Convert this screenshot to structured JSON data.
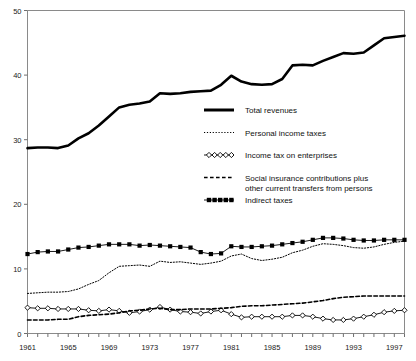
{
  "chart_data": {
    "type": "line",
    "title": "",
    "subtitle": "",
    "xlabel": "",
    "ylabel": "",
    "xlim": [
      1961,
      1998
    ],
    "ylim": [
      0,
      50
    ],
    "yticks": [
      0,
      10,
      20,
      30,
      40,
      50
    ],
    "xticks": [
      1961,
      1965,
      1969,
      1973,
      1977,
      1981,
      1985,
      1989,
      1993,
      1997
    ],
    "xtick_labels": [
      "1961",
      "1965",
      "1969",
      "1973",
      "1977",
      "1981",
      "1985",
      "1989",
      "1993",
      "1997"
    ],
    "ytick_labels": [
      "0",
      "10",
      "20",
      "30",
      "40",
      "50"
    ],
    "x": [
      1961,
      1962,
      1963,
      1964,
      1965,
      1966,
      1967,
      1968,
      1969,
      1970,
      1971,
      1972,
      1973,
      1974,
      1975,
      1976,
      1977,
      1978,
      1979,
      1980,
      1981,
      1982,
      1983,
      1984,
      1985,
      1986,
      1987,
      1988,
      1989,
      1990,
      1991,
      1992,
      1993,
      1994,
      1995,
      1996,
      1997,
      1998
    ],
    "grid": false,
    "legend_position": "center-right",
    "series": [
      {
        "name": "Total revenues",
        "style": "thick-solid",
        "marker": "none",
        "color": "#000000",
        "values": [
          28.7,
          28.8,
          28.8,
          28.7,
          29.1,
          30.2,
          31.0,
          32.2,
          33.6,
          35.0,
          35.4,
          35.6,
          35.9,
          37.2,
          37.1,
          37.2,
          37.4,
          37.5,
          37.6,
          38.5,
          39.9,
          39.0,
          38.6,
          38.5,
          38.6,
          39.4,
          41.5,
          41.6,
          41.5,
          42.2,
          42.8,
          43.4,
          43.3,
          43.5,
          44.6,
          45.7,
          45.9,
          46.1
        ]
      },
      {
        "name": "Personal income taxes",
        "style": "dotted",
        "marker": "none",
        "color": "#000000",
        "values": [
          6.2,
          6.3,
          6.4,
          6.4,
          6.5,
          6.9,
          7.6,
          8.2,
          9.4,
          10.4,
          10.5,
          10.6,
          10.4,
          11.2,
          11.0,
          11.1,
          10.9,
          10.7,
          10.9,
          11.2,
          12.0,
          12.3,
          11.6,
          11.3,
          11.5,
          11.8,
          12.5,
          12.9,
          13.5,
          13.9,
          13.8,
          13.6,
          13.3,
          13.2,
          13.4,
          13.8,
          14.1,
          14.3
        ]
      },
      {
        "name": "Income tax on enterprises",
        "style": "thin-solid",
        "marker": "diamond-open",
        "color": "#000000",
        "values": [
          4.0,
          3.9,
          3.9,
          3.8,
          3.8,
          3.8,
          3.6,
          3.5,
          3.7,
          3.5,
          3.2,
          3.4,
          3.7,
          4.1,
          3.7,
          3.4,
          3.3,
          3.1,
          3.4,
          3.6,
          3.0,
          2.5,
          2.6,
          2.6,
          2.6,
          2.6,
          2.8,
          2.8,
          2.6,
          2.3,
          2.1,
          2.1,
          2.3,
          2.6,
          2.9,
          3.3,
          3.5,
          3.6
        ]
      },
      {
        "name": "Social insurance contributions plus other current transfers from persons",
        "style": "dashed",
        "marker": "none",
        "color": "#000000",
        "values": [
          2.1,
          2.1,
          2.1,
          2.2,
          2.2,
          2.6,
          2.8,
          2.9,
          3.0,
          3.2,
          3.5,
          3.6,
          3.8,
          3.9,
          3.7,
          3.7,
          3.8,
          3.8,
          3.8,
          3.9,
          4.0,
          4.2,
          4.3,
          4.3,
          4.4,
          4.5,
          4.6,
          4.7,
          4.9,
          5.1,
          5.4,
          5.6,
          5.7,
          5.8,
          5.8,
          5.8,
          5.8,
          5.8
        ]
      },
      {
        "name": "Indirect taxes",
        "style": "thin-solid",
        "marker": "square-filled",
        "color": "#000000",
        "values": [
          12.3,
          12.6,
          12.7,
          12.7,
          13.0,
          13.3,
          13.4,
          13.6,
          13.8,
          13.8,
          13.8,
          13.6,
          13.7,
          13.6,
          13.5,
          13.4,
          13.3,
          12.6,
          12.3,
          12.4,
          13.5,
          13.4,
          13.4,
          13.5,
          13.6,
          13.8,
          14.0,
          14.2,
          14.5,
          14.8,
          14.8,
          14.7,
          14.5,
          14.4,
          14.4,
          14.5,
          14.5,
          14.5
        ]
      }
    ]
  },
  "legend": {
    "items": [
      {
        "label": "Total revenues",
        "swatch": "thick-solid"
      },
      {
        "label": "Personal income taxes",
        "swatch": "dotted"
      },
      {
        "label": "Income tax on enterprises",
        "swatch": "diamond-line"
      },
      {
        "label": "Social insurance contributions plus",
        "label2": "other current transfers from persons",
        "swatch": "dashed"
      },
      {
        "label": "Indirect taxes",
        "swatch": "square-line"
      }
    ]
  }
}
